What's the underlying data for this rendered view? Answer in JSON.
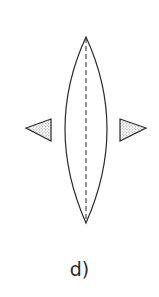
{
  "figure": {
    "caption": "d)",
    "colors": {
      "stroke": "#2b2b2b",
      "fill": "#ffffff",
      "stipple": "#8a8a8a",
      "background": "#ffffff"
    },
    "lens": {
      "top": [
        86,
        37
      ],
      "bottom": [
        86,
        223
      ],
      "left_x": 51,
      "right_x": 120
    },
    "axis": {
      "style": "dashed",
      "from": [
        86,
        37
      ],
      "to": [
        86,
        223
      ]
    },
    "fins": [
      {
        "side": "left",
        "apex": [
          26,
          128
        ],
        "base_top": [
          51,
          119
        ],
        "base_bottom": [
          51,
          141
        ],
        "fill": "stippled"
      },
      {
        "side": "right",
        "apex": [
          146,
          128
        ],
        "base_top": [
          120,
          119
        ],
        "base_bottom": [
          120,
          141
        ],
        "fill": "stippled"
      }
    ]
  }
}
